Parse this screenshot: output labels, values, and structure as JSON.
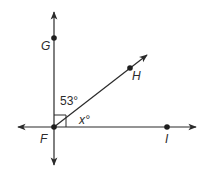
{
  "diagram": {
    "type": "geometry-angle-figure",
    "colors": {
      "line": "#2b2b2b",
      "point": "#1e1e1e",
      "text": "#2b2b2b",
      "background": "#ffffff"
    },
    "points": {
      "F": {
        "label": "F"
      },
      "G": {
        "label": "G"
      },
      "H": {
        "label": "H"
      },
      "I": {
        "label": "I"
      }
    },
    "angles": {
      "GFH": {
        "label": "53°",
        "value": 53
      },
      "HFI": {
        "label": "x°",
        "variable": "x"
      },
      "GFI": {
        "marker": "right-angle",
        "value": 90
      }
    },
    "lines": [
      {
        "name": "vertical-line-FG",
        "through": [
          "F",
          "G"
        ],
        "arrows": "both"
      },
      {
        "name": "horizontal-line-FI",
        "through": [
          "F",
          "I"
        ],
        "arrows": "both"
      },
      {
        "name": "ray-FH",
        "from": "F",
        "through": "H",
        "arrows": "end"
      }
    ]
  }
}
